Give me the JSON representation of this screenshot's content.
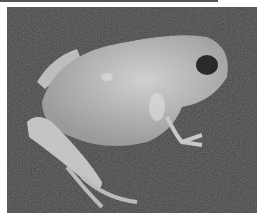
{
  "image": {
    "subject": "frog",
    "alt": "Grayscale photograph of a pale frog sitting on dark textured ground",
    "colors": {
      "background": "#ffffff",
      "ground": "#444444",
      "frog": "#b5b5b5",
      "frog_highlight": "#d8d8d8",
      "eye": "#2a2a2a"
    }
  }
}
